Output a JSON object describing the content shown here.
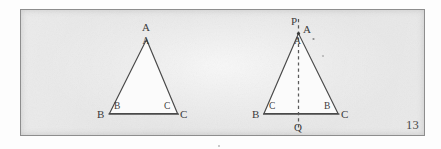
{
  "figure": {
    "caption_page_number": "13",
    "background_color": "#e3e3e3",
    "border_color": "#8d8d8d",
    "ink_color": "#3b3b3b",
    "triangles": [
      {
        "id": "left-triangle",
        "name": "triangle-ABC-plain",
        "apex_outer_label": "A",
        "apex_inner_label": "A",
        "bottom_left_outer_label": "B",
        "bottom_left_inner_label": "B",
        "bottom_right_inner_label": "C",
        "bottom_right_outer_label": "C",
        "has_median": false
      },
      {
        "id": "right-triangle",
        "name": "triangle-ABC-with-median-PQ",
        "top_line_label": "P",
        "apex_outer_label": "A",
        "apex_inner_label": "A",
        "bottom_left_outer_label": "B",
        "bottom_left_inner_label": "C",
        "bottom_right_inner_label": "B",
        "bottom_right_outer_label": "C",
        "median_bottom_label": "Q",
        "has_median": true,
        "median_style": "dashed"
      }
    ]
  }
}
